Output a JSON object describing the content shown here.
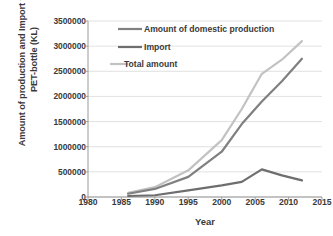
{
  "chart_data": {
    "type": "line",
    "title": "",
    "xlabel": "Year",
    "ylabel": "Amount of production and Import for the PET-bottle (KL)",
    "xlim": [
      1980,
      2015
    ],
    "ylim": [
      0,
      3500000
    ],
    "xticks": [
      "1980",
      "1985",
      "1990",
      "1995",
      "2000",
      "2005",
      "2010",
      "2015"
    ],
    "yticks": [
      "0",
      "500000",
      "1000000",
      "1500000",
      "2000000",
      "2500000",
      "3000000",
      "3500000"
    ],
    "grid": "horizontal",
    "legend_position": "top-left-inside",
    "x": [
      1986,
      1990,
      1995,
      2000,
      2003,
      2006,
      2009,
      2012
    ],
    "series": [
      {
        "name": "Amount of domestic production",
        "color": "#808080",
        "values": [
          65000,
          160000,
          400000,
          900000,
          1450000,
          1900000,
          2300000,
          2750000
        ]
      },
      {
        "name": "Import",
        "color": "#6e6e6e",
        "values": [
          20000,
          35000,
          130000,
          230000,
          300000,
          550000,
          430000,
          330000
        ]
      },
      {
        "name": "Total amount",
        "color": "#c2c2c2",
        "values": [
          85000,
          195000,
          530000,
          1130000,
          1750000,
          2450000,
          2730000,
          3100000
        ]
      }
    ]
  },
  "legend": {
    "items": [
      {
        "label": "Amount of domestic production",
        "color": "#808080"
      },
      {
        "label": "Import",
        "color": "#6e6e6e"
      },
      {
        "label": "Total amount",
        "color": "#c2c2c2"
      }
    ]
  },
  "axes": {
    "x_title": "Year",
    "y_title": "Amount of production and Import for the PET-bottle (KL)"
  },
  "colors": {
    "gridline": "#d9d9d9",
    "axis": "#9a9a9a",
    "text": "#3a3a3a"
  }
}
